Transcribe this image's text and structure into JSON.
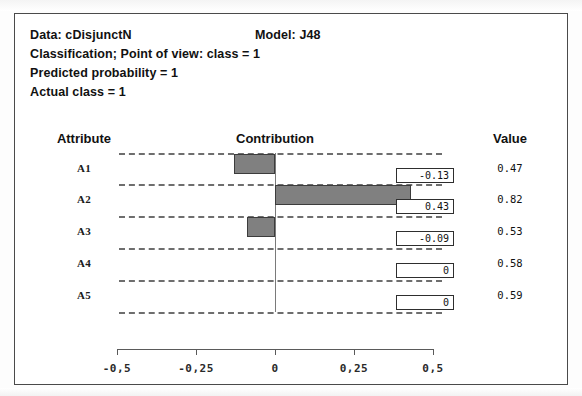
{
  "header": {
    "data_label": "Data: cDisjunctN",
    "model_label": "Model: J48",
    "classification": "Classification; Point of view: class = 1",
    "predicted_probability": "Predicted probability = 1",
    "actual_class": "Actual class = 1"
  },
  "columns": {
    "attribute": "Attribute",
    "contribution": "Contribution",
    "value": "Value"
  },
  "chart_data": {
    "type": "bar",
    "orientation": "horizontal",
    "title": "Contribution",
    "xlabel": "",
    "ylabel": "Attribute",
    "xlim": [
      -0.5,
      0.5
    ],
    "grid": true,
    "legend": null,
    "zero_line": 0,
    "decimal_separator": ",",
    "categories": [
      "A1",
      "A2",
      "A3",
      "A4",
      "A5"
    ],
    "values": [
      -0.13,
      0.43,
      -0.09,
      0,
      0
    ],
    "value_labels": [
      "-0.13",
      "0.43",
      "-0.09",
      "0",
      "0"
    ],
    "attribute_values": [
      "0.47",
      "0.82",
      "0.53",
      "0.58",
      "0.59"
    ],
    "tick_values": [
      -0.5,
      -0.25,
      0,
      0.25,
      0.5
    ],
    "tick_labels": [
      "-0,5",
      "-0,25",
      "0",
      "0,25",
      "0,5"
    ],
    "bar_color": "#808080",
    "bar_border_color": "#3c3c3c",
    "grid_color": "#6e6e6e"
  }
}
